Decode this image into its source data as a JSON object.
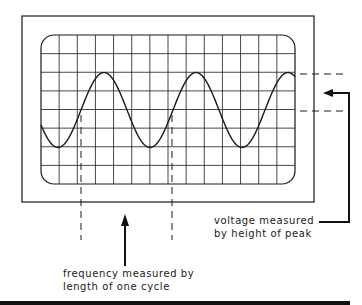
{
  "diagram": {
    "type": "oscilloscope-waveform",
    "colors": {
      "ink": "#1a1a1a",
      "background": "#ffffff",
      "bar": "#111111"
    },
    "screen": {
      "grid_columns": 14,
      "grid_rows": 8
    },
    "waveform": {
      "shape": "sine",
      "cycles_visible": 2.8
    },
    "annotations": {
      "frequency": {
        "line1": "frequency measured by",
        "line2": "length of one cycle"
      },
      "voltage": {
        "line1": "voltage measured",
        "line2": "by height of peak"
      }
    }
  }
}
